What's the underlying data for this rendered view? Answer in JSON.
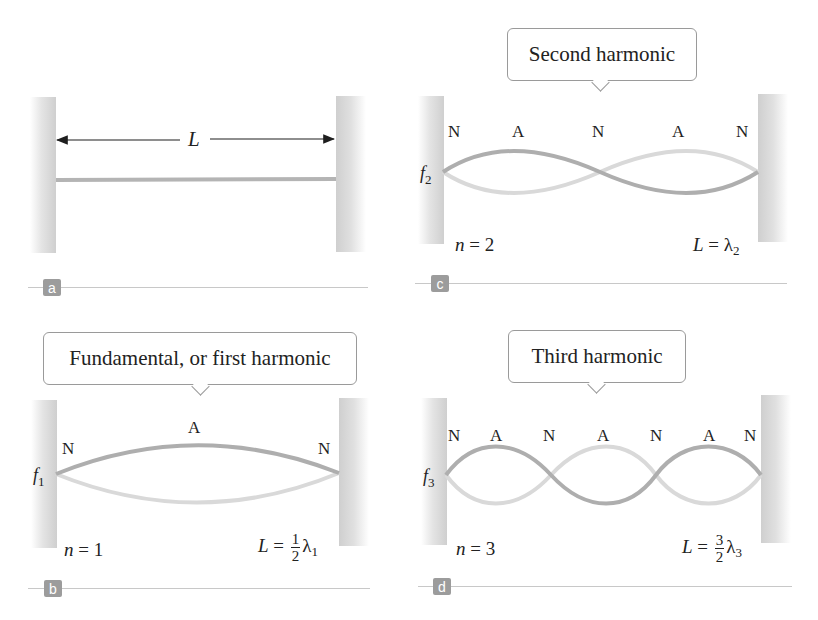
{
  "panels": {
    "a": {
      "badge": "a",
      "length_label": "L",
      "description": "String fixed between two walls, length L"
    },
    "b": {
      "badge": "b",
      "bubble": "Fundamental, or first harmonic",
      "frequency": "f",
      "frequency_sub": "1",
      "nodes": [
        "N",
        "A",
        "N"
      ],
      "n_label": "n",
      "n_value": "= 1",
      "L_label": "L",
      "eq": "=",
      "frac_num": "1",
      "frac_den": "2",
      "lambda": "λ",
      "lambda_sub": "1"
    },
    "c": {
      "badge": "c",
      "bubble": "Second harmonic",
      "frequency": "f",
      "frequency_sub": "2",
      "nodes": [
        "N",
        "A",
        "N",
        "A",
        "N"
      ],
      "n_label": "n",
      "n_value": "= 2",
      "L_label": "L",
      "eq": "=",
      "lambda": "λ",
      "lambda_sub": "2"
    },
    "d": {
      "badge": "d",
      "bubble": "Third harmonic",
      "frequency": "f",
      "frequency_sub": "3",
      "nodes": [
        "N",
        "A",
        "N",
        "A",
        "N",
        "A",
        "N"
      ],
      "n_label": "n",
      "n_value": "= 3",
      "L_label": "L",
      "eq": "=",
      "frac_num": "3",
      "frac_den": "2",
      "lambda": "λ",
      "lambda_sub": "3"
    }
  },
  "colors": {
    "string_dark": "#aeaeae",
    "string_light": "#d9d9d9",
    "wall": "#d0d0d0",
    "badge": "#9c9c9c",
    "rule": "#c8c8c8"
  }
}
